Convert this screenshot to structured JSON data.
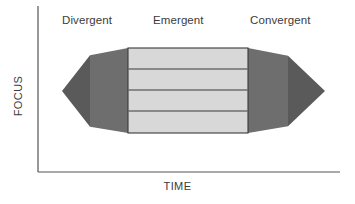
{
  "figure": {
    "type": "double-diamond-process-diagram",
    "title": "",
    "axes": {
      "y_label": "FOCUS",
      "x_label": "TIME",
      "y_axis_line": {
        "x": 38,
        "y_top": 6,
        "y_bottom": 172
      },
      "x_axis_line": {
        "y": 172,
        "x_left": 38,
        "x_right": 340
      },
      "axis_color": "#555555",
      "grid": false,
      "ticks": []
    },
    "phases": [
      {
        "id": "divergent",
        "label": "Divergent",
        "x_start": 62,
        "x_end": 128
      },
      {
        "id": "emergent",
        "label": "Emergent",
        "x_start": 128,
        "x_end": 248
      },
      {
        "id": "convergent",
        "label": "Convergent",
        "x_start": 248,
        "x_end": 325
      }
    ],
    "shapes": {
      "left_triangle": {
        "name": "divergent-triangle",
        "tip": {
          "x": 62,
          "y": 91
        },
        "base_x": 128,
        "base_top_y": 48,
        "base_bottom_y": 133,
        "fill_outer": "#5a5a5a",
        "fill_inner": "#6e6e6e",
        "split_x": 90
      },
      "right_triangle": {
        "name": "convergent-triangle",
        "tip": {
          "x": 325,
          "y": 91
        },
        "base_x": 248,
        "base_top_y": 48,
        "base_bottom_y": 133,
        "fill_inner": "#6e6e6e",
        "fill_outer": "#5a5a5a",
        "split_x": 288
      },
      "center_box": {
        "name": "emergent-box",
        "x": 128,
        "y": 48,
        "width": 120,
        "height": 85,
        "fill": "#d8d8d8",
        "stroke": "#3a3a3a",
        "band_count": 4,
        "divider_y": [
          69,
          90,
          111
        ],
        "divider_color": "#3a3a3a"
      }
    },
    "colors": {
      "background": "#ffffff",
      "text": "#3b3b3b",
      "dark_gray": "#5a5a5a",
      "mid_gray": "#6e6e6e",
      "light_gray": "#d8d8d8",
      "outline": "#3a3a3a"
    }
  }
}
